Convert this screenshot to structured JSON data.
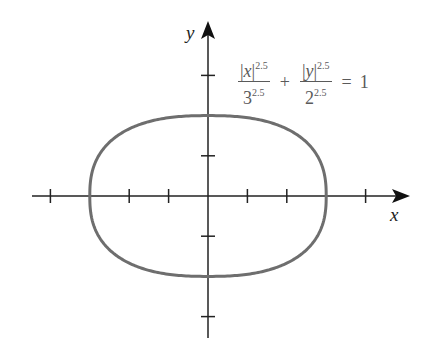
{
  "diagram": {
    "equation": {
      "term1": {
        "numerator_var": "x",
        "numerator_exp": "2.5",
        "denominator_base": "3",
        "denominator_exp": "2.5"
      },
      "operator": "+",
      "term2": {
        "numerator_var": "y",
        "numerator_exp": "2.5",
        "denominator_base": "2",
        "denominator_exp": "2.5"
      },
      "equals": "=",
      "rhs": "1"
    },
    "axes": {
      "x_label": "x",
      "y_label": "y",
      "x_ticks": [
        -4,
        -3,
        -2,
        -1,
        1,
        2,
        3,
        4
      ],
      "y_ticks": [
        -3,
        -2,
        -1,
        1,
        2,
        3
      ]
    },
    "curve": {
      "a": 3,
      "b": 2,
      "n": 2.5,
      "color": "#6e6e6e"
    },
    "colors": {
      "axis": "#222222",
      "text": "#5a5a5a"
    }
  }
}
